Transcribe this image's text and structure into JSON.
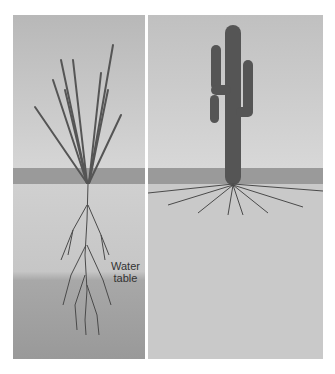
{
  "figure": {
    "panels": [
      {
        "id": "left",
        "subject": "ocotillo-like plant with deep taproot",
        "root_type": "deep-taproot",
        "label": {
          "line1": "Water",
          "line2": "table"
        }
      },
      {
        "id": "right",
        "subject": "saguaro cactus with shallow spreading roots",
        "root_type": "shallow-lateral"
      }
    ],
    "colors": {
      "sky": "#cfcfcf",
      "soil": "#c7c7c7",
      "soil_deep": "#a9a9a9",
      "plant": "#555555",
      "root": "#4a4a4a",
      "ground_line": "#9a9a9a"
    }
  }
}
